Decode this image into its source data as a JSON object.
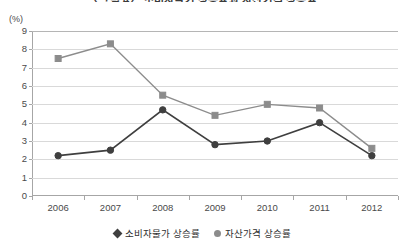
{
  "chart_data": {
    "type": "line",
    "title": "〈그림 4〉 소비자물가 상승률과 자산가격 상승률",
    "xlabel": "",
    "ylabel": "(%)",
    "unit": "(%)",
    "categories": [
      "2006",
      "2007",
      "2008",
      "2009",
      "2010",
      "2011",
      "2012"
    ],
    "ylim": [
      0,
      9
    ],
    "yticks": [
      0,
      1,
      2,
      3,
      4,
      5,
      6,
      7,
      8,
      9
    ],
    "grid": true,
    "legend_position": "bottom",
    "series": [
      {
        "name": "소비자물가 상승률",
        "color": "#3f3f3f",
        "marker": "diamond",
        "values": [
          2.2,
          2.5,
          4.7,
          2.8,
          3.0,
          4.0,
          2.2
        ]
      },
      {
        "name": "자산가격 상승률",
        "color": "#8c8c8c",
        "marker": "square",
        "values": [
          7.5,
          8.3,
          5.5,
          4.4,
          5.0,
          4.8,
          2.6
        ]
      }
    ]
  },
  "axis": {
    "unit_label": "(%)"
  },
  "legend": {
    "items": [
      {
        "label": "소비자물가 상승률",
        "marker": "diamond",
        "color": "#3f3f3f"
      },
      {
        "label": "자산가격 상승률",
        "marker": "circle",
        "color": "#8c8c8c"
      }
    ]
  }
}
